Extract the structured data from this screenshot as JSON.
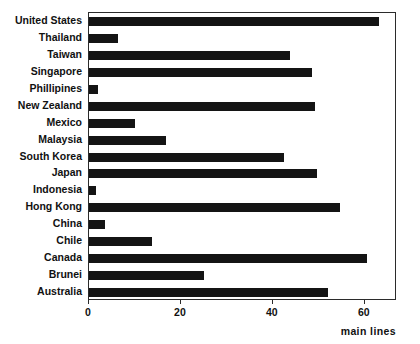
{
  "chart_data": {
    "type": "bar",
    "orientation": "horizontal",
    "title": "",
    "subtitle": "",
    "xlabel": "main lines",
    "ylabel": "",
    "categories": [
      "United States",
      "Thailand",
      "Taiwan",
      "Singapore",
      "Phillipines",
      "New Zealand",
      "Mexico",
      "Malaysia",
      "South Korea",
      "Japan",
      "Indonesia",
      "Hong Kong",
      "China",
      "Chile",
      "Canada",
      "Brunei",
      "Australia"
    ],
    "values": [
      63,
      6.3,
      43.8,
      48.5,
      2,
      49.2,
      10,
      16.7,
      42.5,
      49.7,
      1.6,
      54.7,
      3.4,
      13.8,
      60.4,
      25.1,
      52
    ],
    "xlim": [
      0,
      67
    ],
    "xticks": [
      0,
      20,
      40,
      60
    ],
    "xtick_labels": [
      "0",
      "20",
      "40",
      "60"
    ],
    "grid": false,
    "legend": false,
    "bar_color": "#141414",
    "frame_color": "#2b2b2b",
    "background_color": "#ffffff",
    "text_color": "#111111"
  }
}
